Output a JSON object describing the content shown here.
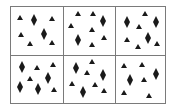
{
  "figure": {
    "grid": {
      "rows": 2,
      "cols": 3,
      "border_color": "#7a7a7a",
      "shape_color": "#1a1a1a"
    },
    "cells": [
      {
        "row": 0,
        "col": 0,
        "diamonds": [
          [
            34,
            20
          ],
          [
            44,
            34
          ]
        ],
        "triangles": [
          [
            20,
            18
          ],
          [
            52,
            19
          ],
          [
            21,
            35
          ],
          [
            30,
            44
          ],
          [
            52,
            43
          ]
        ]
      },
      {
        "row": 0,
        "col": 1,
        "diamonds": [
          [
            103,
            21
          ],
          [
            78,
            40
          ]
        ],
        "triangles": [
          [
            78,
            14
          ],
          [
            93,
            14
          ],
          [
            71,
            26
          ],
          [
            92,
            30
          ],
          [
            104,
            38
          ],
          [
            92,
            45
          ]
        ]
      },
      {
        "row": 0,
        "col": 2,
        "diamonds": [
          [
            127,
            22
          ],
          [
            156,
            22
          ],
          [
            148,
            38
          ]
        ],
        "triangles": [
          [
            145,
            14
          ],
          [
            139,
            27
          ],
          [
            127,
            40
          ],
          [
            138,
            47
          ],
          [
            157,
            44
          ]
        ]
      },
      {
        "row": 1,
        "col": 0,
        "diamonds": [
          [
            22,
            67
          ],
          [
            48,
            78
          ],
          [
            20,
            87
          ],
          [
            38,
            89
          ]
        ],
        "triangles": [
          [
            37,
            68
          ],
          [
            53,
            65
          ],
          [
            30,
            79
          ],
          [
            54,
            90
          ]
        ]
      },
      {
        "row": 1,
        "col": 1,
        "diamonds": [
          [
            76,
            68
          ],
          [
            103,
            75
          ],
          [
            83,
            92
          ]
        ],
        "triangles": [
          [
            92,
            62
          ],
          [
            87,
            73
          ],
          [
            72,
            84
          ],
          [
            95,
            85
          ],
          [
            104,
            91
          ]
        ]
      },
      {
        "row": 1,
        "col": 2,
        "diamonds": [
          [
            156,
            74
          ],
          [
            130,
            80
          ]
        ],
        "triangles": [
          [
            124,
            66
          ],
          [
            142,
            65
          ],
          [
            144,
            80
          ],
          [
            124,
            93
          ],
          [
            149,
            96
          ]
        ]
      }
    ]
  }
}
